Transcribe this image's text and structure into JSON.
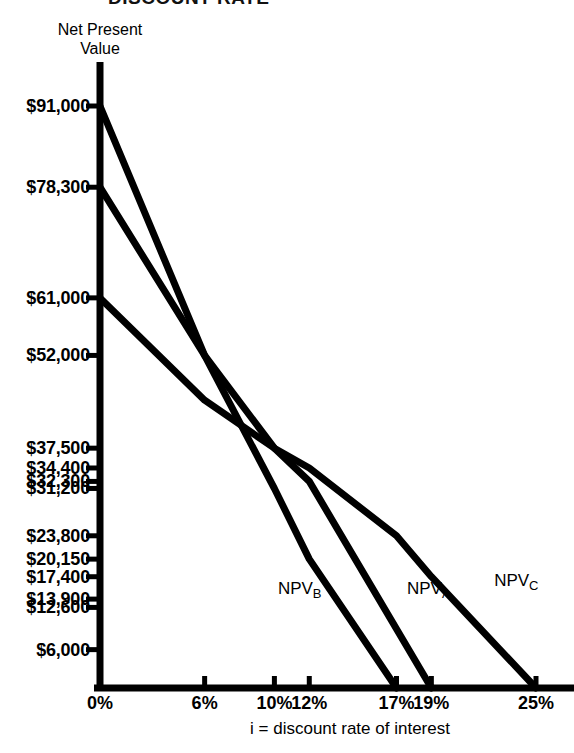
{
  "figure": {
    "title_partial": "DISCOUNT RATE",
    "y_axis_title": "Net Present\nValue",
    "x_axis_title": "i = discount rate of interest"
  },
  "chart_data": {
    "type": "line",
    "title": "DISCOUNT RATE",
    "xlabel": "i = discount rate of interest",
    "ylabel": "Net Present Value",
    "xlim": [
      0,
      27
    ],
    "ylim": [
      0,
      95000
    ],
    "grid": false,
    "legend": "inline-curve-labels",
    "x_tick_values": [
      0,
      6,
      10,
      12,
      17,
      19,
      25
    ],
    "x_tick_labels": [
      "0%",
      "6%",
      "10%",
      "12%",
      "17%",
      "19%",
      "25%"
    ],
    "y_tick_values": [
      91000,
      78300,
      61000,
      52000,
      37500,
      34400,
      32300,
      31200,
      23800,
      20150,
      17400,
      13900,
      12600,
      6000
    ],
    "y_tick_labels": [
      "$91,000",
      "$78,300",
      "$61,000",
      "$52,000",
      "$37,500",
      "$34,400",
      "$32,300",
      "$31,200",
      "$23,800",
      "$20,150",
      "$17,400",
      "$13,900",
      "$12,600",
      "$6,000"
    ],
    "series": [
      {
        "name": "NPV_B",
        "label": "NPV",
        "subscript": "B",
        "x": [
          0,
          6,
          10,
          12,
          17
        ],
        "y": [
          91000,
          52000,
          31200,
          20150,
          0
        ]
      },
      {
        "name": "NPV_A",
        "label": "NPV",
        "subscript": "A",
        "x": [
          0,
          6,
          10,
          12,
          19
        ],
        "y": [
          78300,
          52000,
          37500,
          32300,
          0
        ]
      },
      {
        "name": "NPV_C",
        "label": "NPV",
        "subscript": "C",
        "x": [
          0,
          6,
          10,
          12,
          17,
          19,
          25
        ],
        "y": [
          61000,
          45000,
          37500,
          34400,
          23800,
          17400,
          0
        ]
      }
    ],
    "annotations": [
      {
        "text": "NPV",
        "sub": "B",
        "x": 10.2,
        "y": 15500
      },
      {
        "text": "NPV",
        "sub": "A",
        "x": 17.6,
        "y": 15500
      },
      {
        "text": "NPV",
        "sub": "C",
        "x": 22.6,
        "y": 16800
      }
    ]
  }
}
